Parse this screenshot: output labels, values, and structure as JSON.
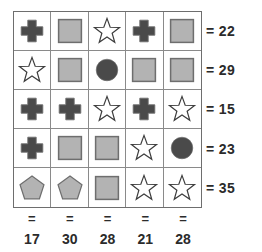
{
  "puzzle": {
    "type": "shape-sum-grid",
    "rows": 5,
    "cols": 5,
    "equals_sign": "=",
    "colors": {
      "dark_shape": "#4a4a4a",
      "light_shape": "#b3b3b3",
      "shape_outline": "#6e6e6e",
      "star_outline": "#3d3d3d",
      "grid_line": "#8a8a8a",
      "grid_border": "#6e6e6e",
      "text": "#2b2b2b",
      "background": "#ffffff"
    },
    "grid": [
      [
        {
          "shape": "cross-icon",
          "fill": "dark"
        },
        {
          "shape": "square-icon",
          "fill": "light"
        },
        {
          "shape": "star-icon",
          "fill": "white"
        },
        {
          "shape": "cross-icon",
          "fill": "dark"
        },
        {
          "shape": "square-icon",
          "fill": "light"
        }
      ],
      [
        {
          "shape": "star-icon",
          "fill": "white"
        },
        {
          "shape": "square-icon",
          "fill": "light"
        },
        {
          "shape": "circle-icon",
          "fill": "dark"
        },
        {
          "shape": "square-icon",
          "fill": "light"
        },
        {
          "shape": "square-icon",
          "fill": "light"
        }
      ],
      [
        {
          "shape": "cross-icon",
          "fill": "dark"
        },
        {
          "shape": "cross-icon",
          "fill": "dark"
        },
        {
          "shape": "star-icon",
          "fill": "white"
        },
        {
          "shape": "cross-icon",
          "fill": "dark"
        },
        {
          "shape": "star-icon",
          "fill": "white"
        }
      ],
      [
        {
          "shape": "cross-icon",
          "fill": "dark"
        },
        {
          "shape": "square-icon",
          "fill": "light"
        },
        {
          "shape": "square-icon",
          "fill": "light"
        },
        {
          "shape": "star-icon",
          "fill": "white"
        },
        {
          "shape": "circle-icon",
          "fill": "dark"
        }
      ],
      [
        {
          "shape": "pentagon-icon",
          "fill": "light"
        },
        {
          "shape": "pentagon-icon",
          "fill": "light"
        },
        {
          "shape": "square-icon",
          "fill": "light"
        },
        {
          "shape": "star-icon",
          "fill": "white"
        },
        {
          "shape": "star-icon",
          "fill": "white"
        }
      ]
    ],
    "row_sums": [
      22,
      29,
      15,
      23,
      35
    ],
    "col_sums": [
      17,
      30,
      28,
      21,
      28
    ]
  }
}
